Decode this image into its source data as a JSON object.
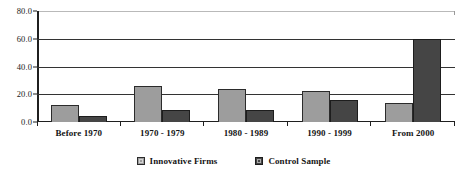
{
  "chart_data": {
    "type": "bar",
    "title": "",
    "subtitle": "",
    "xlabel": "",
    "ylabel": "",
    "ylim": [
      0,
      80
    ],
    "ytick_labels": [
      "0.0",
      "20.0",
      "40.0",
      "60.0",
      "80.0"
    ],
    "ytick_values": [
      0,
      20,
      40,
      60,
      80
    ],
    "grid": true,
    "grid_axis": "y",
    "legend_position": "bottom",
    "categories": [
      "Before 1970",
      "1970 - 1979",
      "1980 - 1989",
      "1990 - 1999",
      "From 2000"
    ],
    "series": [
      {
        "name": "Innovative Firms",
        "color": "#9d9d9d",
        "values": [
          12,
          26,
          24,
          22,
          14
        ]
      },
      {
        "name": "Control Sample",
        "color": "#454545",
        "values": [
          4,
          9,
          9,
          16,
          60
        ]
      }
    ]
  },
  "colors": {
    "series_innovative": "#9d9d9d",
    "series_control": "#454545",
    "gridline": "#333333",
    "axis": "#1f1f1f",
    "plot_top_rule": "#b9b9b9",
    "background": "#ffffff",
    "text": "#151515"
  }
}
